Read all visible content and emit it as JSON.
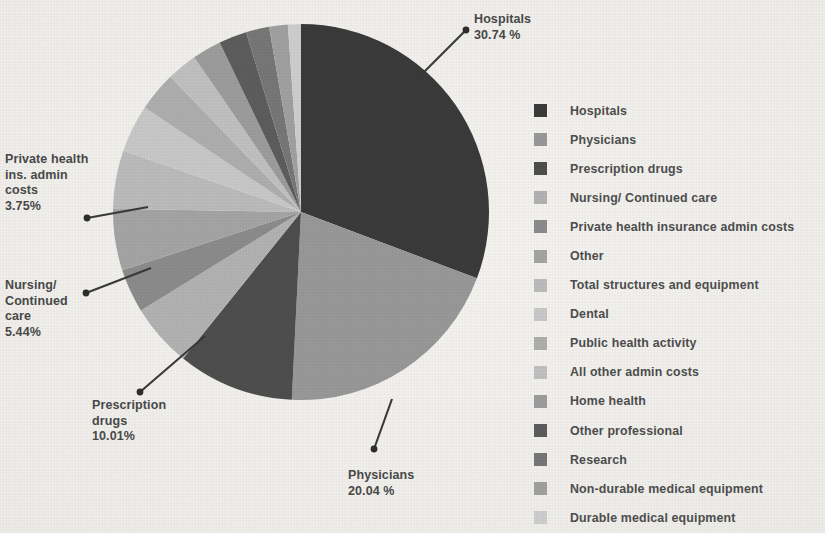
{
  "chart_data": {
    "type": "pie",
    "title": "",
    "categories": [
      "Hospitals",
      "Physicians",
      "Prescription drugs",
      "Nursing/ Continued care",
      "Private health insurance admin costs",
      "Other",
      "Total structures and equipment",
      "Dental",
      "Public health activity",
      "All other admin costs",
      "Home health",
      "Other professional",
      "Research",
      "Non-durable medical equipment",
      "Durable medical equipment"
    ],
    "values": [
      30.74,
      20.04,
      10.01,
      5.44,
      3.75,
      5.3,
      5.0,
      4.1,
      3.4,
      2.6,
      2.5,
      2.4,
      2.0,
      1.6,
      1.12
    ],
    "unit": "%",
    "start_angle_deg": 0,
    "direction": "clockwise",
    "legend_position": "right",
    "colors": [
      "#3b3b3b",
      "#9a9a9a",
      "#4f4f4f",
      "#b4b4b4",
      "#8d8d8d",
      "#a6a6a6",
      "#bdbdbd",
      "#cacaca",
      "#b0b0b0",
      "#c2c2c2",
      "#9e9e9e",
      "#5e5e5e",
      "#787878",
      "#a2a2a2",
      "#d0d0d0"
    ],
    "callouts": [
      {
        "name": "hospitals",
        "label": "Hospitals",
        "value": "30.74 %"
      },
      {
        "name": "physicians",
        "label": "Physicians",
        "value": "20.04 %"
      },
      {
        "name": "prescription",
        "label": "Prescription\ndrugs",
        "value": "10.01%"
      },
      {
        "name": "nursing",
        "label": "Nursing/\nContinued\ncare",
        "value": "5.44%"
      },
      {
        "name": "private-admin",
        "label": "Private health\nins. admin\ncosts",
        "value": "3.75%"
      }
    ]
  },
  "legend": {
    "items": [
      {
        "label": "Hospitals",
        "color": "#3b3b3b"
      },
      {
        "label": "Physicians",
        "color": "#9a9a9a"
      },
      {
        "label": "Prescription drugs",
        "color": "#4f4f4f"
      },
      {
        "label": "Nursing/ Continued care",
        "color": "#b4b4b4"
      },
      {
        "label": "Private health insurance admin costs",
        "color": "#8d8d8d"
      },
      {
        "label": "Other",
        "color": "#a6a6a6"
      },
      {
        "label": "Total structures and equipment",
        "color": "#bdbdbd"
      },
      {
        "label": "Dental",
        "color": "#cacaca"
      },
      {
        "label": "Public health activity",
        "color": "#b0b0b0"
      },
      {
        "label": "All other admin costs",
        "color": "#c2c2c2"
      },
      {
        "label": "Home health",
        "color": "#9e9e9e"
      },
      {
        "label": "Other professional",
        "color": "#5e5e5e"
      },
      {
        "label": "Research",
        "color": "#787878"
      },
      {
        "label": "Non-durable medical equipment",
        "color": "#a2a2a2"
      },
      {
        "label": "Durable medical equipment",
        "color": "#d0d0d0"
      }
    ]
  },
  "callout_text": {
    "hospitals": "Hospitals\n30.74 %",
    "physicians": "Physicians\n20.04 %",
    "prescription_drugs": "Prescription\ndrugs\n10.01%",
    "nursing": "Nursing/\nContinued\ncare\n5.44%",
    "private_admin": "Private health\nins. admin\ncosts\n3.75%"
  }
}
